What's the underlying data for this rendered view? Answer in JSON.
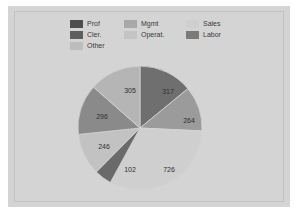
{
  "figure": {
    "background_color": "#d4d4d4",
    "frame_border_color": "#c2c2c2",
    "page_background": "#ffffff"
  },
  "legend": {
    "entries": [
      {
        "label": "Prof",
        "color": "#4d4d4d"
      },
      {
        "label": "Mgmt",
        "color": "#a8a8a8"
      },
      {
        "label": "Sales",
        "color": "#cfcfcf"
      },
      {
        "label": "Cler.",
        "color": "#5e5e5e"
      },
      {
        "label": "Operat.",
        "color": "#c4c4c4"
      },
      {
        "label": "Labor",
        "color": "#7a7a7a"
      },
      {
        "label": "Other",
        "color": "#bdbdbd"
      }
    ]
  },
  "chart_data": {
    "type": "pie",
    "title": "",
    "legend_position": "top",
    "categories": [
      "Prof",
      "Cler.",
      "Other",
      "Mgmt",
      "Operat.",
      "Sales",
      "Labor"
    ],
    "labels": [
      "317",
      "264",
      "726",
      "102",
      "246",
      "296",
      "305"
    ],
    "values": [
      317,
      264,
      726,
      102,
      246,
      296,
      305
    ],
    "colors": [
      "#6f6f6f",
      "#9b9b9b",
      "#cfcfcf",
      "#6a6a6a",
      "#c2c2c2",
      "#8a8a8a",
      "#b5b5b5"
    ],
    "total": 2256,
    "slices": [
      {
        "label": "317",
        "value": 317,
        "color": "#6f6f6f",
        "label_x": 92,
        "label_y": 28
      },
      {
        "label": "264",
        "value": 264,
        "color": "#9b9b9b",
        "label_x": 113,
        "label_y": 57
      },
      {
        "label": "726",
        "value": 726,
        "color": "#cfcfcf",
        "label_x": 93,
        "label_y": 106
      },
      {
        "label": "102",
        "value": 102,
        "color": "#6a6a6a",
        "label_x": 54,
        "label_y": 106
      },
      {
        "label": "246",
        "value": 246,
        "color": "#c2c2c2",
        "label_x": 28,
        "label_y": 83
      },
      {
        "label": "296",
        "value": 296,
        "color": "#8a8a8a",
        "label_x": 26,
        "label_y": 53
      },
      {
        "label": "305",
        "value": 305,
        "color": "#b5b5b5",
        "label_x": 54,
        "label_y": 27
      }
    ]
  }
}
